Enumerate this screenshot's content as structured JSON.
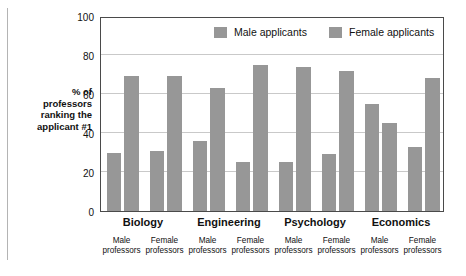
{
  "chart_data": {
    "type": "bar",
    "title": "",
    "subtitle": "",
    "xlabel": "",
    "ylabel": "% of professors ranking the applicant #1",
    "ylim": [
      0,
      100
    ],
    "yticks": [
      0,
      20,
      40,
      60,
      80,
      100
    ],
    "grid": true,
    "legend_position": "top-right",
    "categories": [
      "Biology / Male professors",
      "Biology / Female professors",
      "Engineering / Male professors",
      "Engineering / Female professors",
      "Psychology / Male professors",
      "Psychology / Female professors",
      "Economics / Male professors",
      "Economics / Female professors"
    ],
    "groups": [
      "Biology",
      "Engineering",
      "Psychology",
      "Economics"
    ],
    "subgroups": [
      "Male professors",
      "Female professors",
      "Male professors",
      "Female professors",
      "Male professors",
      "Female professors",
      "Male professors",
      "Female professors"
    ],
    "series": [
      {
        "name": "Male applicants",
        "values": [
          30,
          31,
          36,
          25,
          25,
          29,
          55,
          33
        ],
        "color": "#979797"
      },
      {
        "name": "Female applicants",
        "values": [
          69,
          69,
          63,
          75,
          74,
          72,
          45,
          68
        ],
        "color": "#979797"
      }
    ],
    "bars": [
      {
        "group": "Biology",
        "professors": "Male professors",
        "applicant": "Male applicants",
        "value": 30
      },
      {
        "group": "Biology",
        "professors": "Male professors",
        "applicant": "Female applicants",
        "value": 69
      },
      {
        "group": "Biology",
        "professors": "Female professors",
        "applicant": "Male applicants",
        "value": 31
      },
      {
        "group": "Biology",
        "professors": "Female professors",
        "applicant": "Female applicants",
        "value": 69
      },
      {
        "group": "Engineering",
        "professors": "Male professors",
        "applicant": "Male applicants",
        "value": 36
      },
      {
        "group": "Engineering",
        "professors": "Male professors",
        "applicant": "Female applicants",
        "value": 63
      },
      {
        "group": "Engineering",
        "professors": "Female professors",
        "applicant": "Male applicants",
        "value": 25
      },
      {
        "group": "Engineering",
        "professors": "Female professors",
        "applicant": "Female applicants",
        "value": 75
      },
      {
        "group": "Psychology",
        "professors": "Male professors",
        "applicant": "Male applicants",
        "value": 25
      },
      {
        "group": "Psychology",
        "professors": "Male professors",
        "applicant": "Female applicants",
        "value": 74
      },
      {
        "group": "Psychology",
        "professors": "Female professors",
        "applicant": "Male applicants",
        "value": 29
      },
      {
        "group": "Psychology",
        "professors": "Female professors",
        "applicant": "Female applicants",
        "value": 72
      },
      {
        "group": "Economics",
        "professors": "Male professors",
        "applicant": "Male applicants",
        "value": 55
      },
      {
        "group": "Economics",
        "professors": "Male professors",
        "applicant": "Female applicants",
        "value": 45
      },
      {
        "group": "Economics",
        "professors": "Female professors",
        "applicant": "Male applicants",
        "value": 33
      },
      {
        "group": "Economics",
        "professors": "Female professors",
        "applicant": "Female applicants",
        "value": 68
      }
    ]
  },
  "axis": {
    "caption_lines": [
      "% of",
      "professors",
      "ranking the",
      "applicant #1"
    ]
  },
  "legend": {
    "items": [
      {
        "label": "Male applicants",
        "color": "#979797"
      },
      {
        "label": "Female applicants",
        "color": "#979797"
      }
    ]
  },
  "style": {
    "bar_color": "#979797",
    "frame_color": "#4a4a4a",
    "gridline_color": "#c9c9c9",
    "background": "#ffffff",
    "text_color": "#111111"
  }
}
